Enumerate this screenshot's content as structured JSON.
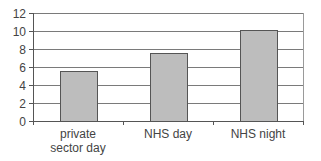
{
  "chart_data": {
    "type": "bar",
    "title": "",
    "xlabel": "",
    "ylabel": "",
    "categories": [
      [
        "private",
        "sector day"
      ],
      [
        "NHS day"
      ],
      [
        "NHS night"
      ]
    ],
    "category_names": [
      "private sector day",
      "NHS day",
      "NHS night"
    ],
    "values": [
      5.6,
      7.6,
      10.1
    ],
    "ylim": [
      0,
      12
    ],
    "yticks": [
      0,
      2,
      4,
      6,
      8,
      10,
      12
    ],
    "grid": true,
    "legend": null
  },
  "colors": {
    "bar_fill": "#bdbdbd",
    "bar_stroke": "#555555",
    "grid": "#7a7a7a",
    "axis": "#555555",
    "frame": "#9a9a9a"
  }
}
